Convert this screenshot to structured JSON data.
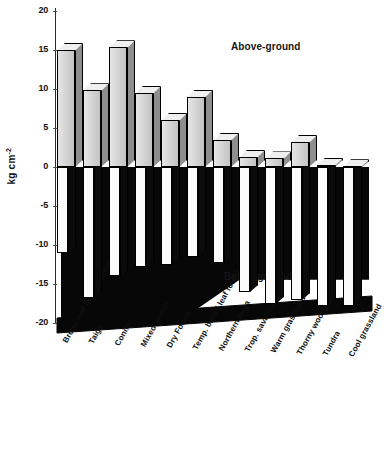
{
  "chart_data": {
    "type": "bar",
    "title": "",
    "subtitle": "",
    "xlabel": "",
    "ylabel": "kg cm-2",
    "ylabel_html": "kg cm⁻²",
    "ylim": [
      -20,
      20
    ],
    "yticks": [
      20,
      15,
      10,
      5,
      0,
      -5,
      -10,
      -15,
      -20
    ],
    "ytick_labels": [
      "20",
      "15",
      "10",
      "5",
      "0",
      "-5",
      "-10",
      "-15",
      "-20"
    ],
    "grid": false,
    "legend_position": "none",
    "categories": [
      "Broad leaf humid forest",
      "Taiga",
      "Conifer",
      "Mixed woods",
      "Dry Forest",
      "Temp. broad leaf forest",
      "Northern taiga",
      "Trop. savanna",
      "Warm grassland",
      "Thorny woods",
      "Tundra",
      "Cool grassland"
    ],
    "series": [
      {
        "name": "Above-ground",
        "values": [
          15.0,
          9.8,
          15.3,
          9.5,
          6.0,
          9.0,
          3.5,
          1.3,
          1.1,
          3.2,
          0.3,
          0.1
        ]
      },
      {
        "name": "Below-ground",
        "values": [
          -11.0,
          -16.8,
          -14.0,
          -12.8,
          -12.5,
          -11.5,
          -12.3,
          -16.0,
          -17.5,
          -17.0,
          -17.8,
          -17.8
        ]
      }
    ],
    "annotations": [
      {
        "text": "Above-ground",
        "x": 231,
        "y": 41
      },
      {
        "text": "Below-ground",
        "x": 224,
        "y": 271
      }
    ]
  },
  "axis": {
    "y_label": "kg cm",
    "y_label_sup": "-2",
    "ticks": [
      "20",
      "15",
      "10",
      "5",
      "0",
      "-5",
      "-10",
      "-15",
      "-20"
    ]
  },
  "annotations": {
    "above_ground": "Above-ground",
    "below_ground": "Below-ground"
  },
  "categories": [
    "Broad leaf humid forest",
    "Taiga",
    "Conifer",
    "Mixed woods",
    "Dry Forest",
    "Temp. broad leaf forest",
    "Northern taiga",
    "Trop. savanna",
    "Warm grassland",
    "Thorny woods",
    "Tundra",
    "Cool grassland"
  ],
  "colors": {
    "above_ground_fill": "#d9d9d9",
    "below_ground_fill": "#fbfbfb",
    "soil_mass": "#070707",
    "outline": "#000000",
    "text": "#111111"
  }
}
